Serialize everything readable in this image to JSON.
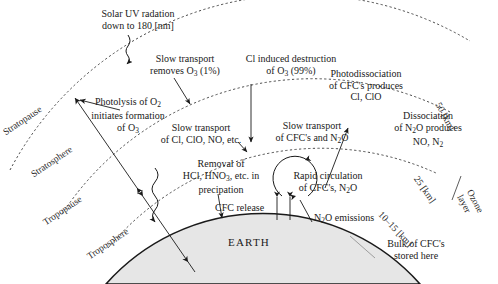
{
  "diagram": {
    "earth_label": "EARTH",
    "earth_fill": "#e6e6e6",
    "line_color": "#1a1a1a"
  },
  "annotations": {
    "solar_uv": "Solar UV radation\ndown to 180 [nm]",
    "slow_transport_o3": "Slow transport\nremoves O₃ (1%)",
    "cl_induced": "Cl induced destruction\nof O₃ (99%)",
    "photodissociation": "Photodissociation\nof CFC's produces\nCl, ClO",
    "photolysis": "Photolysis of O₂\ninitiates formation\nof O₃",
    "slow_transport_cl": "Slow transport\nof Cl, ClO, NO, etc.",
    "slow_transport_cfc": "Slow transport\nof CFC's and N₂O",
    "dissociation_n2o": "Dissociation\nof N₂O produces\nNO, N₂",
    "removal": "Removal of\nHCl, HNO₃, etc. in\nprecipation",
    "rapid_circulation": "Rapid circulation\nof CFC's, N₂O",
    "cfc_release": "CFC release",
    "n2o_emissions": "N₂O emissions",
    "bulk_cfc": "Bulk of CFC's\nstored here"
  },
  "layers": {
    "stratopause": "Stratopause",
    "stratosphere": "Stratosphere",
    "tropopause": "Tropopause",
    "troposphere": "Troposphere"
  },
  "altitudes": {
    "alt_50": "50 [km]",
    "alt_25": "25 [km]",
    "alt_10_15": "10–15 [km]",
    "ozone_layer": "Ozone\nlayer"
  }
}
